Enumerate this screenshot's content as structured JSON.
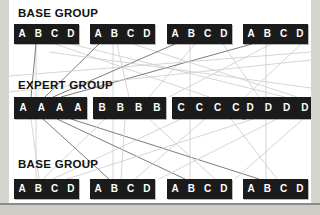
{
  "diagram": {
    "title_semantics": "mixture-of-experts routing diagram",
    "panel": {
      "background_color": "#ffffff",
      "page_background_color": "#d6d4cf"
    },
    "node_color": "#1b1b1b",
    "node_text_color": "#ffffff",
    "edge_color_dark": "#6e6e6e",
    "edge_color_light": "#d0d0d0",
    "rows": [
      {
        "id": "row-top",
        "label": "BASE GROUP",
        "label_x": 9,
        "label_y": 8,
        "box_y": 24,
        "box_h": 20,
        "boxes": [
          {
            "x": 5,
            "w": 65,
            "cells": [
              "A",
              "B",
              "C",
              "D"
            ]
          },
          {
            "x": 81,
            "w": 65,
            "cells": [
              "A",
              "B",
              "C",
              "D"
            ]
          },
          {
            "x": 158,
            "w": 65,
            "cells": [
              "A",
              "B",
              "C",
              "D"
            ]
          },
          {
            "x": 234,
            "w": 65,
            "cells": [
              "A",
              "B",
              "C",
              "D"
            ]
          }
        ]
      },
      {
        "id": "row-middle",
        "label": "EXPERT GROUP",
        "label_x": 9,
        "label_y": 80,
        "box_y": 97,
        "box_h": 22,
        "boxes": [
          {
            "x": 5,
            "w": 73,
            "cells": [
              "A",
              "A",
              "A",
              "A"
            ]
          },
          {
            "x": 84,
            "w": 73,
            "cells": [
              "B",
              "B",
              "B",
              "B"
            ]
          },
          {
            "x": 163,
            "w": 73,
            "cells": [
              "C",
              "C",
              "C",
              "C"
            ]
          },
          {
            "x": 232,
            "w": 73,
            "cells": [
              "D",
              "D",
              "D",
              "D"
            ]
          }
        ]
      },
      {
        "id": "row-bottom",
        "label": "BASE GROUP",
        "label_x": 9,
        "label_y": 159,
        "box_y": 179,
        "box_h": 20,
        "boxes": [
          {
            "x": 5,
            "w": 65,
            "cells": [
              "A",
              "B",
              "C",
              "D"
            ]
          },
          {
            "x": 81,
            "w": 65,
            "cells": [
              "A",
              "B",
              "C",
              "D"
            ]
          },
          {
            "x": 158,
            "w": 65,
            "cells": [
              "A",
              "B",
              "C",
              "D"
            ]
          },
          {
            "x": 234,
            "w": 65,
            "cells": [
              "A",
              "B",
              "C",
              "D"
            ]
          }
        ]
      }
    ],
    "edges": [
      {
        "x1": 27,
        "y1": 44,
        "x2": 27,
        "y2": 179,
        "shade": "light"
      },
      {
        "x1": 104,
        "y1": 44,
        "x2": 104,
        "y2": 179,
        "shade": "light"
      },
      {
        "x1": 181,
        "y1": 44,
        "x2": 181,
        "y2": 179,
        "shade": "light"
      },
      {
        "x1": 257,
        "y1": 44,
        "x2": 257,
        "y2": 179,
        "shade": "light"
      },
      {
        "x1": 27,
        "y1": 44,
        "x2": 22,
        "y2": 97,
        "shade": "dark"
      },
      {
        "x1": 46,
        "y1": 44,
        "x2": 200,
        "y2": 97,
        "shade": "light"
      },
      {
        "x1": 62,
        "y1": 44,
        "x2": 276,
        "y2": 97,
        "shade": "light"
      },
      {
        "x1": 90,
        "y1": 44,
        "x2": 36,
        "y2": 97,
        "shade": "dark"
      },
      {
        "x1": 108,
        "y1": 44,
        "x2": 120,
        "y2": 97,
        "shade": "light"
      },
      {
        "x1": 124,
        "y1": 44,
        "x2": 288,
        "y2": 97,
        "shade": "light"
      },
      {
        "x1": 166,
        "y1": 44,
        "x2": 44,
        "y2": 97,
        "shade": "dark"
      },
      {
        "x1": 186,
        "y1": 44,
        "x2": 140,
        "y2": 97,
        "shade": "light"
      },
      {
        "x1": 214,
        "y1": 44,
        "x2": 250,
        "y2": 97,
        "shade": "light"
      },
      {
        "x1": 243,
        "y1": 44,
        "x2": 52,
        "y2": 97,
        "shade": "dark"
      },
      {
        "x1": 262,
        "y1": 44,
        "x2": 160,
        "y2": 97,
        "shade": "light"
      },
      {
        "x1": 292,
        "y1": 44,
        "x2": 236,
        "y2": 97,
        "shade": "light"
      },
      {
        "x1": 22,
        "y1": 119,
        "x2": 30,
        "y2": 179,
        "shade": "light"
      },
      {
        "x1": 34,
        "y1": 119,
        "x2": 100,
        "y2": 179,
        "shade": "dark"
      },
      {
        "x1": 48,
        "y1": 119,
        "x2": 176,
        "y2": 179,
        "shade": "dark"
      },
      {
        "x1": 62,
        "y1": 119,
        "x2": 250,
        "y2": 179,
        "shade": "dark"
      },
      {
        "x1": 96,
        "y1": 119,
        "x2": 34,
        "y2": 179,
        "shade": "light"
      },
      {
        "x1": 116,
        "y1": 119,
        "x2": 112,
        "y2": 179,
        "shade": "light"
      },
      {
        "x1": 140,
        "y1": 119,
        "x2": 206,
        "y2": 179,
        "shade": "light"
      },
      {
        "x1": 172,
        "y1": 119,
        "x2": 44,
        "y2": 179,
        "shade": "light"
      },
      {
        "x1": 196,
        "y1": 119,
        "x2": 126,
        "y2": 179,
        "shade": "light"
      },
      {
        "x1": 222,
        "y1": 119,
        "x2": 268,
        "y2": 179,
        "shade": "light"
      },
      {
        "x1": 244,
        "y1": 119,
        "x2": 58,
        "y2": 179,
        "shade": "light"
      },
      {
        "x1": 268,
        "y1": 119,
        "x2": 150,
        "y2": 179,
        "shade": "light"
      },
      {
        "x1": 294,
        "y1": 119,
        "x2": 226,
        "y2": 179,
        "shade": "light"
      },
      {
        "x1": 0,
        "y1": 76,
        "x2": 302,
        "y2": 52,
        "shade": "light"
      },
      {
        "x1": 0,
        "y1": 92,
        "x2": 302,
        "y2": 60,
        "shade": "light"
      },
      {
        "x1": 302,
        "y1": 88,
        "x2": 40,
        "y2": 52,
        "shade": "light"
      }
    ]
  }
}
